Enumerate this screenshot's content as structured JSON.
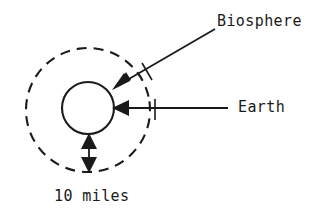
{
  "diagram": {
    "type": "schematic-cross-section",
    "background_color": "#ffffff",
    "stroke_color": "#1a1a1a",
    "labels": {
      "biosphere": "Biosphere",
      "earth": "Earth",
      "scale": "10 miles"
    },
    "shapes": {
      "outer_circle": {
        "name": "biosphere-boundary",
        "style": "dashed",
        "center_x": 88,
        "center_y": 110,
        "radius": 62,
        "stroke_width": 2.1,
        "dash_length": 10,
        "gap_length": 7
      },
      "inner_circle": {
        "name": "earth-body",
        "style": "solid",
        "center_x": 88,
        "center_y": 108,
        "radius": 26,
        "stroke_width": 2.1
      }
    },
    "annotations": {
      "biosphere_leader": {
        "from_x": 215,
        "from_y": 29,
        "to_x": 114,
        "to_y": 88,
        "arrowhead": "filled-triangle-at-end",
        "tick": true
      },
      "earth_leader": {
        "from_x": 228,
        "from_y": 108,
        "to_x": 113,
        "to_y": 108,
        "arrowhead": "filled-triangle-at-end",
        "tick": true,
        "tick_x": 155
      },
      "scale_arrow": {
        "x": 89,
        "top_y": 134,
        "bottom_y": 172,
        "arrowhead": "filled-triangle-both-ends",
        "measures": "10 miles"
      }
    }
  }
}
